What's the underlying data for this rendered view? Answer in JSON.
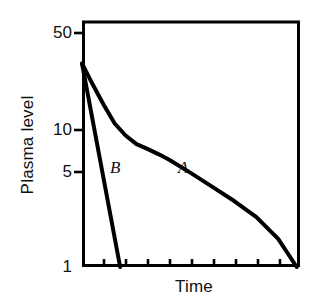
{
  "figure": {
    "background_color": "#ffffff",
    "ink_color": "#000000",
    "width": 319,
    "height": 304
  },
  "axes": {
    "y_title": "Plasma level",
    "x_title": "Time",
    "y_tick_labels": [
      "50",
      "10",
      "5",
      "1"
    ],
    "frame": {
      "left": 82,
      "top": 22,
      "right": 300,
      "bottom": 267,
      "line_width": 3
    }
  },
  "curve_labels": {
    "a": "A",
    "b": "B"
  },
  "chart_data": {
    "type": "line",
    "title": "",
    "subtitle": "",
    "xlabel": "Time",
    "ylabel": "Plasma level",
    "yscale": "log",
    "xscale": "linear",
    "ylim": [
      1,
      60
    ],
    "xlim": [
      0,
      10
    ],
    "grid": false,
    "legend": "inline-curve-labels",
    "y_ticks": [
      1,
      5,
      10,
      50
    ],
    "y_tick_labels": [
      "1",
      "5",
      "10",
      "50"
    ],
    "x_ticks": [
      0,
      1,
      2,
      3,
      4,
      5,
      6,
      7,
      8,
      9,
      10
    ],
    "x_tick_labels": [
      "",
      "",
      "",
      "",
      "",
      "",
      "",
      "",
      "",
      "",
      ""
    ],
    "annotations": [
      {
        "text": "A",
        "x": 4.6,
        "y": 5.6,
        "style": "italic"
      },
      {
        "text": "B",
        "x": 1.5,
        "y": 5.6,
        "style": "italic"
      }
    ],
    "series": [
      {
        "name": "A",
        "label": "A",
        "description": "Biexponential (two-compartment) plasma decay: rapid distribution phase followed by slower elimination phase",
        "color": "#000000",
        "line_width": 4,
        "x": [
          0.0,
          0.5,
          1.0,
          1.5,
          2.0,
          2.5,
          3.0,
          3.5,
          4.0,
          5.0,
          6.0,
          7.0,
          8.0,
          9.0,
          9.85
        ],
        "y": [
          30.0,
          21.0,
          15.0,
          11.0,
          9.0,
          7.8,
          7.2,
          6.6,
          6.0,
          4.8,
          3.8,
          3.0,
          2.3,
          1.6,
          1.0
        ]
      },
      {
        "name": "B",
        "label": "B",
        "description": "Monoexponential (one-compartment) plasma decay: single straight log-linear elimination line",
        "color": "#000000",
        "line_width": 4,
        "x": [
          0.0,
          1.75
        ],
        "y": [
          30.0,
          1.0
        ]
      }
    ]
  }
}
